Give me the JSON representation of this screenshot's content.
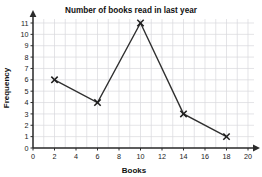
{
  "chart_data": {
    "type": "line",
    "title": "Number of books read in last year",
    "xlabel": "Books",
    "ylabel": "Frequency",
    "x": [
      2,
      6,
      10,
      14,
      18
    ],
    "values": [
      6,
      4,
      11,
      3,
      1
    ],
    "points": [
      {
        "x": 2,
        "y": 6
      },
      {
        "x": 6,
        "y": 4
      },
      {
        "x": 10,
        "y": 11
      },
      {
        "x": 14,
        "y": 3
      },
      {
        "x": 18,
        "y": 1
      }
    ],
    "xlim": [
      0,
      20
    ],
    "ylim": [
      0,
      11
    ],
    "x_ticks": [
      0,
      2,
      4,
      6,
      8,
      10,
      12,
      14,
      16,
      18,
      20
    ],
    "y_ticks": [
      0,
      1,
      2,
      3,
      4,
      5,
      6,
      7,
      8,
      9,
      10,
      11
    ],
    "x_tick_labels": [
      "0",
      "2",
      "4",
      "6",
      "8",
      "10",
      "12",
      "14",
      "16",
      "18",
      "20"
    ],
    "y_tick_labels": [
      "0",
      "1",
      "2",
      "3",
      "4",
      "5",
      "6",
      "7",
      "8",
      "9",
      "10",
      "11"
    ],
    "x_grid_step": 1,
    "y_grid_step": 1,
    "grid": true,
    "legend": null,
    "marker": "x-cross",
    "axis_arrows": true,
    "colors": {
      "line": "#2f2f2f",
      "marker": "#1d1d1d",
      "grid": "#d8d8dc",
      "axis": "#2b2b2b",
      "background": "#ffffff",
      "text": "#111111"
    }
  }
}
